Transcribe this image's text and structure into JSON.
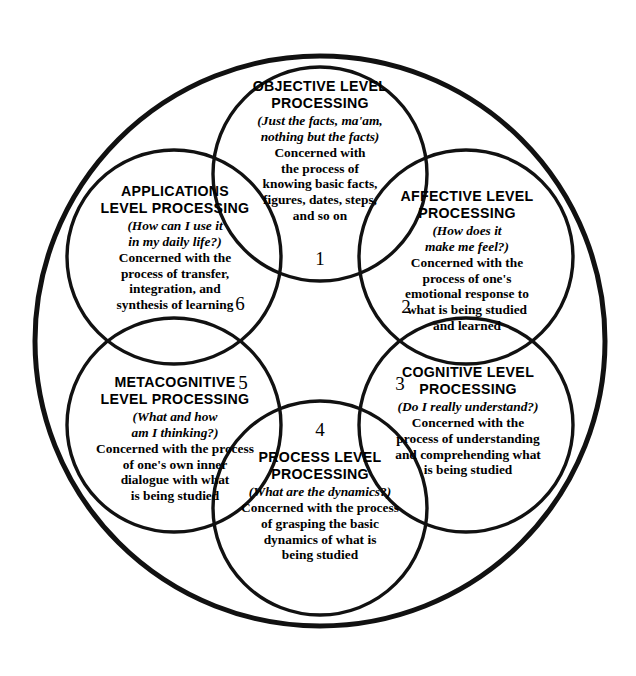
{
  "diagram": {
    "name": "Levels of Processing",
    "shape": "concentric-ring-of-six-circles",
    "outer_circle": {
      "cx": 320,
      "cy": 341,
      "r": 285,
      "stroke": "#111111",
      "stroke_width": 5
    },
    "node_radius": 107,
    "node_stroke": "#111111",
    "node_stroke_width": 3.4,
    "background": "#ffffff",
    "text_color": "#000000"
  },
  "nodes": [
    {
      "id": "objective",
      "title": "OBJECTIVE LEVEL\nPROCESSING",
      "question": "(Just the facts, ma'am,\nnothing but the facts)",
      "body": "Concerned with\nthe process of\nknowing basic facts,\nfigures, dates, steps,\nand so on",
      "cx": 320,
      "cy": 174,
      "text_top": 78,
      "text_left": 208,
      "text_width": 224
    },
    {
      "id": "affective",
      "title": "AFFECTIVE LEVEL\nPROCESSING",
      "question": "(How does it\nmake me feel?)",
      "body": "Concerned with the\nprocess of one's\nemotional response to\nwhat is being studied\nand learned",
      "cx": 466,
      "cy": 257,
      "text_top": 188,
      "text_left": 356,
      "text_width": 222
    },
    {
      "id": "cognitive",
      "title": "COGNITIVE LEVEL\nPROCESSING",
      "question": "(Do I really understand?)",
      "body": "Concerned with the\nprocess of understanding\nand comprehending what\nis being studied",
      "cx": 466,
      "cy": 425,
      "text_top": 364,
      "text_left": 354,
      "text_width": 228
    },
    {
      "id": "process",
      "title": "PROCESS LEVEL\nPROCESSING",
      "question": "(What are the dynamics?)",
      "body": "Concerned with the process\nof grasping the basic\ndynamics of what is\nbeing studied",
      "cx": 320,
      "cy": 508,
      "text_top": 449,
      "text_left": 200,
      "text_width": 240
    },
    {
      "id": "metacognitive",
      "title": "METACOGNITIVE\nLEVEL PROCESSING",
      "question": "(What and how\nam I thinking?)",
      "body": "Concerned with the process\nof one's own inner\ndialogue with what\nis being studied",
      "cx": 174,
      "cy": 425,
      "text_top": 374,
      "text_left": 56,
      "text_width": 238
    },
    {
      "id": "applications",
      "title": "APPLICATIONS\nLEVEL PROCESSING",
      "question": "(How can I use it\nin my daily life?)",
      "body": "Concerned with the\nprocess of transfer,\nintegration, and\nsynthesis of learning",
      "cx": 174,
      "cy": 257,
      "text_top": 183,
      "text_left": 60,
      "text_width": 230
    }
  ],
  "numbers": [
    {
      "label": "1",
      "x": 320,
      "y": 249,
      "for": "objective"
    },
    {
      "label": "2",
      "x": 406,
      "y": 297,
      "for": "affective"
    },
    {
      "label": "3",
      "x": 400,
      "y": 374,
      "for": "cognitive"
    },
    {
      "label": "4",
      "x": 320,
      "y": 420,
      "for": "process"
    },
    {
      "label": "5",
      "x": 243,
      "y": 373,
      "for": "metacognitive"
    },
    {
      "label": "6",
      "x": 240,
      "y": 294,
      "for": "applications"
    }
  ]
}
